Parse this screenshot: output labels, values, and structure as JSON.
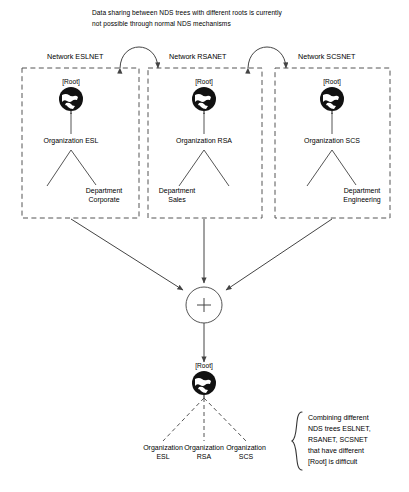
{
  "diagram": {
    "caption": {
      "line1": "Data sharing between NDS trees with different roots is currently",
      "line2": "not possible through normal NDS mechanisms"
    },
    "networks": [
      {
        "label": "Network ESLNET",
        "root": "[Root]",
        "root_icon": "globe-icon",
        "organization": "Organization ESL",
        "department_line1": "Department",
        "department_line2": "Corporate",
        "department_side": "right"
      },
      {
        "label": "Network RSANET",
        "root": "[Root]",
        "root_icon": "globe-icon",
        "organization": "Organization RSA",
        "department_line1": "Department",
        "department_line2": "Sales",
        "department_side": "left"
      },
      {
        "label": "Network SCSNET",
        "root": "[Root]",
        "root_icon": "globe-icon",
        "organization": "Organization SCS",
        "department_line1": "Department",
        "department_line2": "Engineering",
        "department_side": "right"
      }
    ],
    "merge_node": {
      "symbol": "+",
      "icon": "plus-circle-icon"
    },
    "merged_tree": {
      "root": "[Root]",
      "root_icon": "globe-icon",
      "organizations": [
        {
          "line1": "Organization",
          "line2": "ESL"
        },
        {
          "line1": "Organization",
          "line2": "RSA"
        },
        {
          "line1": "Organization",
          "line2": "SCS"
        }
      ]
    },
    "callout": {
      "brace_icon": "curly-brace-icon",
      "line1": "Combining different",
      "line2": "NDS trees ESLNET,",
      "line3": "RSANET, SCSNET",
      "line4": "that have different",
      "line5": "[Root] is difficult"
    },
    "colors": {
      "stroke": "#555555",
      "ink": "#000000",
      "background": "#ffffff"
    }
  }
}
